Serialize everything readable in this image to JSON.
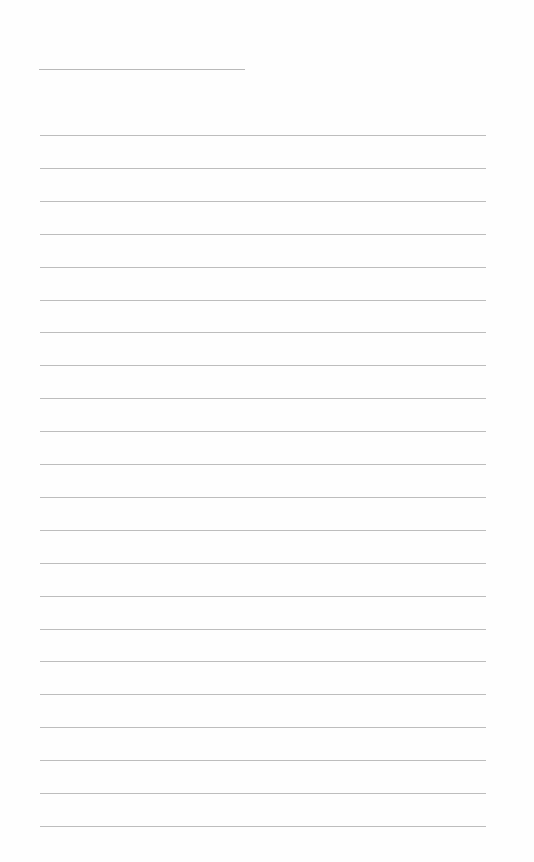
{
  "document": {
    "type": "lined-paper",
    "header_line": {
      "label": "",
      "value": ""
    },
    "lines": [
      {
        "text": ""
      },
      {
        "text": ""
      },
      {
        "text": ""
      },
      {
        "text": ""
      },
      {
        "text": ""
      },
      {
        "text": ""
      },
      {
        "text": ""
      },
      {
        "text": ""
      },
      {
        "text": ""
      },
      {
        "text": ""
      },
      {
        "text": ""
      },
      {
        "text": ""
      },
      {
        "text": ""
      },
      {
        "text": ""
      },
      {
        "text": ""
      },
      {
        "text": ""
      },
      {
        "text": ""
      },
      {
        "text": ""
      },
      {
        "text": ""
      },
      {
        "text": ""
      },
      {
        "text": ""
      },
      {
        "text": ""
      }
    ],
    "line_color": "#bdbdbd",
    "background_color": "#ffffff"
  }
}
